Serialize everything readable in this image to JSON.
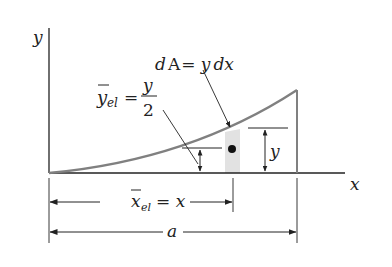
{
  "figure": {
    "axes": {
      "x_label": "x",
      "y_label": "y"
    },
    "element": {
      "area_label_d": "d",
      "area_label_A": "A",
      "area_label_eq": "= y",
      "area_label_dx": "dx",
      "height_label": "y"
    },
    "centroid": {
      "y_el_symbol": "y",
      "y_el_subscript": "el",
      "y_el_eq": "=",
      "y_el_numerator": "y",
      "y_el_denominator": "2",
      "x_el_symbol": "x",
      "x_el_subscript": "el",
      "x_el_value": "= x"
    },
    "dimension": {
      "total_width": "a"
    },
    "colors": {
      "axis": "#222222",
      "curve": "#808080",
      "strip": "#e2e2e2"
    }
  }
}
